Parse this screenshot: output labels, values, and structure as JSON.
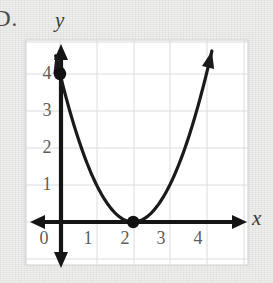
{
  "problem": {
    "item_letter": "D."
  },
  "figure": {
    "x_axis_label": "x",
    "y_axis_label": "y",
    "background_color": "#ededeb",
    "plot_background_color": "#ffffff",
    "grid_color": "#d8d8dc",
    "axis_color": "#1a1a1a",
    "curve_color": "#1a1a1a",
    "point_color": "#111111"
  },
  "chart_data": {
    "type": "line",
    "title": "",
    "xlabel": "x",
    "ylabel": "y",
    "grid": true,
    "legend": null,
    "xlim": [
      -0.9,
      5.0
    ],
    "ylim": [
      -0.9,
      5.0
    ],
    "xticks": [
      0,
      1,
      2,
      3,
      4
    ],
    "xtick_labels": [
      "0",
      "1",
      "2",
      "3",
      "4"
    ],
    "yticks": [
      1,
      2,
      3,
      4
    ],
    "ytick_labels": [
      "1",
      "2",
      "3",
      "4"
    ],
    "series": [
      {
        "name": "parabola",
        "equation": "y = (x - 2)^2",
        "x": [
          -0.12,
          0.0,
          0.25,
          0.5,
          0.75,
          1.0,
          1.25,
          1.5,
          1.75,
          2.0,
          2.25,
          2.5,
          2.75,
          3.0,
          3.25,
          3.5,
          3.75,
          4.0,
          4.15
        ],
        "y": [
          4.49,
          4.0,
          3.06,
          2.25,
          1.56,
          1.0,
          0.56,
          0.25,
          0.06,
          0.0,
          0.06,
          0.25,
          0.56,
          1.0,
          1.56,
          2.25,
          3.06,
          4.0,
          4.62
        ],
        "arrow_start": true,
        "arrow_end": true
      }
    ],
    "points": [
      {
        "label": "y-intercept",
        "x": 0,
        "y": 4
      },
      {
        "label": "vertex",
        "x": 2,
        "y": 0
      }
    ]
  }
}
